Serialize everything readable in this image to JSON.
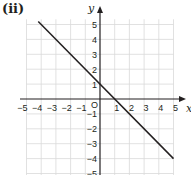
{
  "figure": {
    "part_label": "(ii)",
    "x_axis_label": "x",
    "y_axis_label": "y",
    "origin_label": "O",
    "colors": {
      "grid": "#d9d9d9",
      "axes": "#231f20",
      "line": "#231f20",
      "text": "#231f20"
    }
  },
  "chart_data": {
    "type": "line",
    "title": "(ii)",
    "xlabel": "x",
    "ylabel": "y",
    "xlim": [
      -5,
      5
    ],
    "ylim": [
      -5,
      5
    ],
    "grid": true,
    "x_ticks": [
      -5,
      -4,
      -3,
      -2,
      -1,
      1,
      2,
      3,
      4,
      5
    ],
    "y_ticks": [
      5,
      4,
      3,
      2,
      1,
      -1,
      -2,
      -3,
      -4,
      -5
    ],
    "x_tick_labels": [
      "−5",
      "−4",
      "−3",
      "−2",
      "−1",
      "1",
      "2",
      "3",
      "4",
      "5"
    ],
    "y_tick_labels": [
      "5",
      "4",
      "3",
      "2",
      "1",
      "−1",
      "−2",
      "−3",
      "−4",
      "−5"
    ],
    "series": [
      {
        "name": "y = -x + 1",
        "equation": "y = -x + 1",
        "x": [
          -4.2,
          5
        ],
        "y": [
          5.2,
          -4
        ],
        "passes_through": [
          [
            0,
            1
          ],
          [
            1,
            0
          ]
        ]
      }
    ]
  }
}
